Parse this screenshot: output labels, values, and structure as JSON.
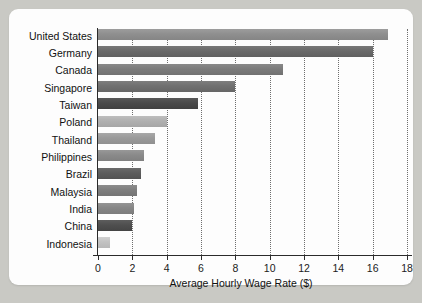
{
  "chart_data": {
    "type": "bar",
    "orientation": "horizontal",
    "title": "",
    "xlabel": "Average Hourly Wage Rate ($)",
    "ylabel": "",
    "xlim": [
      0,
      18
    ],
    "xticks": [
      0,
      2,
      4,
      6,
      8,
      10,
      12,
      14,
      16,
      18
    ],
    "xtick_labels": [
      "0",
      "2",
      "4",
      "6",
      "8",
      "10",
      "12",
      "14",
      "16",
      "18"
    ],
    "grid": "vertical-dotted",
    "legend": "none",
    "categories": [
      "United States",
      "Germany",
      "Canada",
      "Singapore",
      "Taiwan",
      "Poland",
      "Thailand",
      "Philippines",
      "Brazil",
      "Malaysia",
      "India",
      "China",
      "Indonesia"
    ],
    "values": [
      16.9,
      16.0,
      10.8,
      8.0,
      5.8,
      4.0,
      3.3,
      2.7,
      2.5,
      2.3,
      2.1,
      2.0,
      0.7
    ],
    "bar_colors": [
      "#8f8f8f",
      "#6a6a6a",
      "#7b7b7b",
      "#707070",
      "#4a4a4a",
      "#b0b0b0",
      "#9a9a9a",
      "#8a8a8a",
      "#5c5c5c",
      "#7e7e7e",
      "#868686",
      "#4f4f4f",
      "#c2c2c2"
    ],
    "axis_color": "#2b2b2b",
    "gridline_color": "#6e6e6e",
    "card_color": "#fdfdfd",
    "background_color": "#c9c9c4"
  }
}
